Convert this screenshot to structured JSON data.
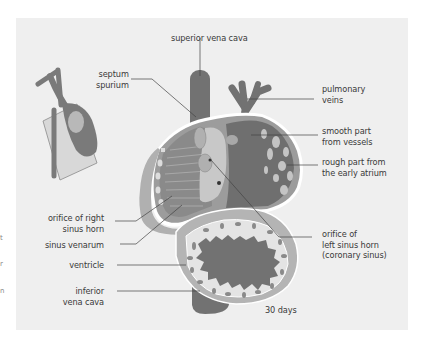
{
  "figure": {
    "caption_stage": "30 days",
    "colors": {
      "background": "#efefef",
      "dark_tissue": "#6f6f6f",
      "mid_tissue": "#9a9a9a",
      "light_tissue": "#c4c4c4",
      "pale_tissue": "#e2e2e2",
      "outline": "#ffffff",
      "leader_line": "#444444",
      "text": "#3a3a3a"
    },
    "labels": {
      "superior_vena_cava": "superior vena cava",
      "septum_spurium": "septum\nspurium",
      "pulmonary_veins": "pulmonary\nveins",
      "smooth_part": "smooth part\nfrom vessels",
      "rough_part": "rough part from\nthe early atrium",
      "orifice_right_sinus_horn": "orifice of right\nsinus horn",
      "sinus_venarum": "sinus venarum",
      "ventricle": "ventricle",
      "inferior_vena_cava": "inferior\nvena cava",
      "orifice_left_sinus_horn": "orifice of\nleft sinus horn\n(coronary sinus)"
    },
    "edge_marks": [
      "t",
      "r",
      "n"
    ]
  }
}
